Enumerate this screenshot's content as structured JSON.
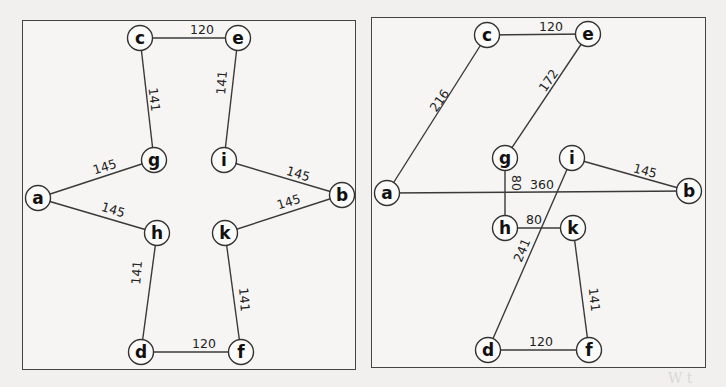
{
  "footer_fragment": "W t",
  "graphs": [
    {
      "id": "left",
      "panel": {
        "x": 22,
        "y": 20,
        "w": 334,
        "h": 350
      },
      "nodes": [
        {
          "id": "c",
          "label": "c",
          "x": 140,
          "y": 38
        },
        {
          "id": "e",
          "label": "e",
          "x": 238,
          "y": 38
        },
        {
          "id": "g",
          "label": "g",
          "x": 154,
          "y": 160
        },
        {
          "id": "i",
          "label": "i",
          "x": 224,
          "y": 160
        },
        {
          "id": "a",
          "label": "a",
          "x": 38,
          "y": 198
        },
        {
          "id": "b",
          "label": "b",
          "x": 342,
          "y": 195
        },
        {
          "id": "h",
          "label": "h",
          "x": 157,
          "y": 233
        },
        {
          "id": "k",
          "label": "k",
          "x": 225,
          "y": 233
        },
        {
          "id": "d",
          "label": "d",
          "x": 141,
          "y": 352
        },
        {
          "id": "f",
          "label": "f",
          "x": 241,
          "y": 352
        }
      ],
      "edges": [
        {
          "from": "c",
          "to": "e",
          "weight": "120",
          "lx": 202,
          "ly": 34,
          "rot": 0
        },
        {
          "from": "c",
          "to": "g",
          "weight": "141",
          "lx": 150,
          "ly": 100,
          "rot": 83
        },
        {
          "from": "e",
          "to": "i",
          "weight": "141",
          "lx": 226,
          "ly": 83,
          "rot": -85
        },
        {
          "from": "a",
          "to": "g",
          "weight": "145",
          "lx": 106,
          "ly": 171,
          "rot": -17
        },
        {
          "from": "a",
          "to": "h",
          "weight": "145",
          "lx": 112,
          "ly": 214,
          "rot": 17
        },
        {
          "from": "i",
          "to": "b",
          "weight": "145",
          "lx": 297,
          "ly": 178,
          "rot": 17
        },
        {
          "from": "k",
          "to": "b",
          "weight": "145",
          "lx": 290,
          "ly": 206,
          "rot": -17
        },
        {
          "from": "h",
          "to": "d",
          "weight": "141",
          "lx": 141,
          "ly": 273,
          "rot": -85
        },
        {
          "from": "k",
          "to": "f",
          "weight": "141",
          "lx": 240,
          "ly": 300,
          "rot": 85
        },
        {
          "from": "d",
          "to": "f",
          "weight": "120",
          "lx": 204,
          "ly": 348,
          "rot": 0
        }
      ]
    },
    {
      "id": "right",
      "panel": {
        "x": 371,
        "y": 17,
        "w": 335,
        "h": 351
      },
      "nodes": [
        {
          "id": "c",
          "label": "c",
          "x": 487,
          "y": 35
        },
        {
          "id": "e",
          "label": "e",
          "x": 588,
          "y": 34
        },
        {
          "id": "g",
          "label": "g",
          "x": 505,
          "y": 158
        },
        {
          "id": "i",
          "label": "i",
          "x": 572,
          "y": 158
        },
        {
          "id": "a",
          "label": "a",
          "x": 387,
          "y": 193
        },
        {
          "id": "b",
          "label": "b",
          "x": 689,
          "y": 191
        },
        {
          "id": "h",
          "label": "h",
          "x": 505,
          "y": 228
        },
        {
          "id": "k",
          "label": "k",
          "x": 573,
          "y": 228
        },
        {
          "id": "d",
          "label": "d",
          "x": 488,
          "y": 350
        },
        {
          "id": "f",
          "label": "f",
          "x": 589,
          "y": 350
        }
      ],
      "edges": [
        {
          "from": "c",
          "to": "e",
          "weight": "120",
          "lx": 551,
          "ly": 31,
          "rot": 0
        },
        {
          "from": "a",
          "to": "c",
          "weight": "216",
          "lx": 443,
          "ly": 103,
          "rot": -55
        },
        {
          "from": "e",
          "to": "g",
          "weight": "172",
          "lx": 552,
          "ly": 83,
          "rot": -55
        },
        {
          "from": "g",
          "to": "h",
          "weight": "80",
          "lx": 512,
          "ly": 183,
          "rot": 90
        },
        {
          "from": "a",
          "to": "b",
          "weight": "360",
          "lx": 542,
          "ly": 189,
          "rot": 0
        },
        {
          "from": "i",
          "to": "b",
          "weight": "145",
          "lx": 644,
          "ly": 175,
          "rot": 15
        },
        {
          "from": "h",
          "to": "k",
          "weight": "80",
          "lx": 534,
          "ly": 224,
          "rot": 0
        },
        {
          "from": "i",
          "to": "d",
          "weight": "241",
          "lx": 526,
          "ly": 252,
          "rot": -67
        },
        {
          "from": "k",
          "to": "f",
          "weight": "141",
          "lx": 590,
          "ly": 300,
          "rot": 84
        },
        {
          "from": "d",
          "to": "f",
          "weight": "120",
          "lx": 541,
          "ly": 346,
          "rot": 0
        }
      ]
    }
  ]
}
